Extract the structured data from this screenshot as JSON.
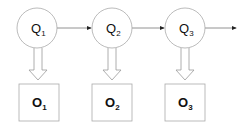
{
  "diagram": {
    "type": "hidden-markov-model",
    "states": [
      {
        "id": "q1",
        "label": "Q",
        "sub": "1",
        "cx": 37,
        "cy": 28
      },
      {
        "id": "q2",
        "label": "Q",
        "sub": "2",
        "cx": 112,
        "cy": 28
      },
      {
        "id": "q3",
        "label": "Q",
        "sub": "3",
        "cx": 185,
        "cy": 28
      }
    ],
    "observations": [
      {
        "id": "o1",
        "label": "O",
        "sub": "1",
        "x": 19,
        "y": 84
      },
      {
        "id": "o2",
        "label": "O",
        "sub": "2",
        "x": 92,
        "y": 84
      },
      {
        "id": "o3",
        "label": "O",
        "sub": "3",
        "x": 165,
        "y": 84
      }
    ],
    "colors": {
      "stroke": "#999999",
      "text": "#111111",
      "arrow": "#222222"
    }
  }
}
